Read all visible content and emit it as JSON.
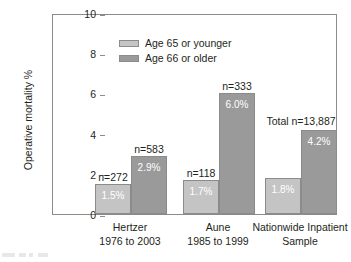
{
  "chart_data": {
    "type": "bar",
    "title": "",
    "xlabel": "",
    "ylabel": "Operative mortality %",
    "ylim": [
      0,
      10
    ],
    "yticks": [
      "0",
      "2",
      "4",
      "6",
      "8",
      "10"
    ],
    "grid": false,
    "legend_position": "top-left",
    "categories": [
      "Hertzer\n1976 to 2003",
      "Aune\n1985 to 1999",
      "Nationwide Inpatient Sample"
    ],
    "category_lines": [
      [
        "Hertzer",
        "1976 to 2003"
      ],
      [
        "Aune",
        "1985 to 1999"
      ],
      [
        "Nationwide Inpatient",
        "Sample"
      ]
    ],
    "series": [
      {
        "name": "Age 65 or younger",
        "color": "#c4c4c4",
        "values": [
          1.5,
          1.7,
          1.8
        ],
        "value_labels": [
          "1.5%",
          "1.7%",
          "1.8%"
        ],
        "n_labels": [
          "n=272",
          "n=118",
          ""
        ]
      },
      {
        "name": "Age 66 or older",
        "color": "#9a9a9a",
        "values": [
          2.9,
          6.0,
          4.2
        ],
        "value_labels": [
          "2.9%",
          "6.0%",
          "4.2%"
        ],
        "n_labels": [
          "n=583",
          "n=333",
          ""
        ]
      }
    ],
    "annotations": [
      {
        "text": "Total n=13,887",
        "group": 2
      }
    ]
  },
  "legend": {
    "items": [
      {
        "label": "Age 65 or younger",
        "color": "#c4c4c4"
      },
      {
        "label": "Age 66 or older",
        "color": "#9a9a9a"
      }
    ]
  },
  "axis": {
    "y_title": "Operative mortality %",
    "y_ticks": [
      "10",
      "8",
      "6",
      "4",
      "2",
      "0"
    ]
  },
  "colors": {
    "series_light": "#c4c4c4",
    "series_dark": "#9a9a9a",
    "axis": "#8b8b8b",
    "text": "#231f20",
    "value_label": "#ffffff"
  }
}
